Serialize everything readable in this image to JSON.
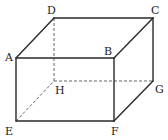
{
  "figure": {
    "type": "rectangular-prism",
    "vertices": {
      "A": {
        "x": 16,
        "y": 58
      },
      "B": {
        "x": 114,
        "y": 58
      },
      "C": {
        "x": 153,
        "y": 18
      },
      "D": {
        "x": 54,
        "y": 18
      },
      "E": {
        "x": 16,
        "y": 121
      },
      "F": {
        "x": 114,
        "y": 121
      },
      "G": {
        "x": 153,
        "y": 81
      },
      "H": {
        "x": 54,
        "y": 81
      }
    },
    "labels": {
      "A": "A",
      "B": "B",
      "C": "C",
      "D": "D",
      "E": "E",
      "F": "F",
      "G": "G",
      "H": "H"
    },
    "solid_edges": [
      "AB",
      "BC",
      "CD",
      "DA",
      "AE",
      "BF",
      "CG",
      "EF",
      "FG"
    ],
    "hidden_edges": [
      "DH",
      "EH",
      "HG"
    ],
    "colors": {
      "line": "#2a2a2a",
      "hidden_line": "#555555",
      "background": "#ffffff"
    }
  }
}
